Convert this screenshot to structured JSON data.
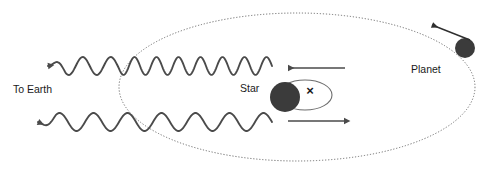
{
  "diagram": {
    "background_color": "#ffffff",
    "stroke_color": "#4a4a4a",
    "body_color": "#3b3b3b",
    "text_color": "#1a1a1a",
    "width": 500,
    "height": 183
  },
  "labels": {
    "to_earth": "To Earth",
    "star": "Star",
    "planet": "Planet",
    "barycenter": "×"
  },
  "orbit": {
    "name": "planet-orbit-ellipse",
    "style": "dotted",
    "center_x": 297,
    "center_y": 87,
    "radius_x": 178,
    "radius_y": 74
  },
  "star_orbit": {
    "name": "star-wobble-ellipse",
    "style": "solid",
    "center_x": 305,
    "center_y": 95,
    "radius_x": 27,
    "radius_y": 15
  },
  "star_body": {
    "name": "star-disk",
    "center_x": 285,
    "center_y": 97,
    "radius": 15
  },
  "planet_body": {
    "name": "planet-disk",
    "center_x": 465,
    "center_y": 48,
    "radius": 10
  },
  "barycenter_mark": {
    "x": 310,
    "y": 92
  },
  "waves": [
    {
      "name": "blueshifted-light-wave",
      "shift": "blueshift",
      "description": "Shorter wavelength light emitted while star moves toward Earth",
      "y": 66,
      "x_start": 48,
      "x_end": 272,
      "amplitude": 9,
      "wavelength_outside": 28,
      "wavelength_inside": 22,
      "arrow_direction": "left"
    },
    {
      "name": "redshifted-light-wave",
      "shift": "redshift",
      "description": "Longer wavelength light emitted while star moves away from Earth",
      "y": 122,
      "x_start": 38,
      "x_end": 272,
      "amplitude": 9,
      "wavelength_outside": 34,
      "wavelength_inside": 34,
      "arrow_direction": "left"
    }
  ],
  "motion_arrows": [
    {
      "name": "star-motion-arrow-toward-earth",
      "direction": "left",
      "x1": 345,
      "x2": 288,
      "y": 68
    },
    {
      "name": "star-motion-arrow-away-from-earth",
      "direction": "right",
      "x1": 288,
      "x2": 345,
      "y": 121
    },
    {
      "name": "planet-orbital-direction-arrow",
      "direction": "up-left",
      "x1": 470,
      "x2": 432,
      "y1": 40,
      "y2": 25
    }
  ]
}
